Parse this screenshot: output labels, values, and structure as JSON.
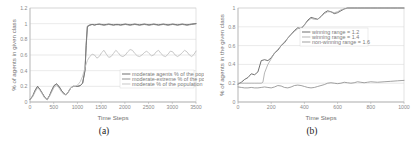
{
  "figure": {
    "panels": [
      {
        "id": "panel-a",
        "caption": "(a)",
        "chart_data": {
          "type": "line",
          "title": "",
          "xlabel": "Time Steps",
          "ylabel": "% of agents in given class",
          "xlim": [
            0,
            3500
          ],
          "ylim": [
            0,
            1.2
          ],
          "xticks": [
            0,
            500,
            1000,
            1500,
            2000,
            2500,
            3000,
            3500
          ],
          "xticklabels": [
            "0",
            "500",
            "1000",
            "1500",
            "2000",
            "2500",
            "3000",
            "3500"
          ],
          "yticks": [
            0,
            0.2,
            0.4,
            0.6,
            0.8,
            1,
            1.2
          ],
          "yticklabels": [
            "0",
            "0.2",
            "0.4",
            "0.6",
            "0.8",
            "1",
            "1.2"
          ],
          "grid": true,
          "legend_position": "lower-right",
          "series": [
            {
              "name": "moderate agents % of the population = 1.2",
              "color": "#555555",
              "x": [
                0,
                60,
                110,
                160,
                210,
                260,
                310,
                360,
                410,
                460,
                510,
                560,
                610,
                660,
                710,
                760,
                810,
                860,
                910,
                960,
                1010,
                1060,
                1110,
                1160,
                1185,
                1210,
                1260,
                1310,
                1360,
                1410,
                1460,
                1510,
                1560,
                1610,
                1660,
                1710,
                1760,
                1810,
                1860,
                1910,
                1960,
                2010,
                2060,
                2110,
                2160,
                2210,
                2260,
                2310,
                2360,
                2410,
                2460,
                2510,
                2560,
                2610,
                2660,
                2710,
                2760,
                2810,
                2860,
                2910,
                2960,
                3010,
                3060,
                3110,
                3160,
                3210,
                3260,
                3310,
                3360,
                3410,
                3460,
                3500
              ],
              "y": [
                0.03,
                0.08,
                0.15,
                0.2,
                0.16,
                0.11,
                0.06,
                0.03,
                0.08,
                0.15,
                0.21,
                0.23,
                0.2,
                0.15,
                0.11,
                0.09,
                0.13,
                0.18,
                0.2,
                0.2,
                0.2,
                0.21,
                0.24,
                0.4,
                0.72,
                0.96,
                0.98,
                0.99,
                0.985,
                0.99,
                0.995,
                0.99,
                0.985,
                0.99,
                0.995,
                0.99,
                0.985,
                0.99,
                0.99,
                0.985,
                0.99,
                0.995,
                0.99,
                0.985,
                0.99,
                0.995,
                0.99,
                0.985,
                0.99,
                0.995,
                0.99,
                0.985,
                0.99,
                0.995,
                0.99,
                0.985,
                0.99,
                0.995,
                0.99,
                0.985,
                0.99,
                0.995,
                0.99,
                0.985,
                0.99,
                0.995,
                0.99,
                0.985,
                0.99,
                0.995,
                0.998,
                1.0
              ]
            },
            {
              "name": "moderate-extreme % of the population = 1.4",
              "color": "#7d7d7d",
              "x": [
                0,
                60,
                110,
                160,
                210,
                260,
                310,
                360,
                410,
                460,
                510,
                560,
                610,
                660,
                710,
                760,
                810,
                860,
                910,
                960,
                1010,
                1060,
                1110,
                1160,
                1185,
                1210,
                1260,
                1310,
                1360,
                1410,
                1460,
                1510,
                1560,
                1610,
                1660,
                1710,
                1760,
                1810,
                1860,
                1910,
                1960,
                2010,
                2060,
                2110,
                2160,
                2210,
                2260,
                2310,
                2360,
                2410,
                2460,
                2510,
                2560,
                2610,
                2660,
                2710,
                2760,
                2810,
                2860,
                2910,
                2960,
                3010,
                3060,
                3110,
                3160,
                3210,
                3260,
                3310,
                3360,
                3410,
                3460,
                3500
              ],
              "y": [
                0.03,
                0.08,
                0.15,
                0.2,
                0.16,
                0.11,
                0.06,
                0.03,
                0.08,
                0.15,
                0.21,
                0.23,
                0.2,
                0.15,
                0.11,
                0.09,
                0.13,
                0.18,
                0.2,
                0.2,
                0.2,
                0.21,
                0.24,
                0.42,
                0.75,
                0.97,
                0.985,
                0.99,
                0.98,
                0.99,
                0.99,
                0.985,
                0.98,
                0.985,
                0.99,
                0.985,
                0.98,
                0.985,
                0.985,
                0.98,
                0.985,
                0.99,
                0.985,
                0.98,
                0.985,
                0.99,
                0.985,
                0.98,
                0.985,
                0.99,
                0.985,
                0.98,
                0.985,
                0.99,
                0.985,
                0.98,
                0.985,
                0.99,
                0.985,
                0.98,
                0.985,
                0.99,
                0.985,
                0.98,
                0.985,
                0.99,
                0.985,
                0.98,
                0.985,
                0.99,
                0.995,
                1.0
              ]
            },
            {
              "name": "moderate % of the population = 1.6",
              "color": "#bdbdbd",
              "x": [
                0,
                60,
                110,
                160,
                210,
                260,
                310,
                360,
                410,
                460,
                510,
                560,
                610,
                660,
                710,
                760,
                810,
                860,
                910,
                960,
                1010,
                1060,
                1110,
                1160,
                1210,
                1260,
                1310,
                1360,
                1410,
                1460,
                1510,
                1560,
                1610,
                1660,
                1710,
                1760,
                1810,
                1860,
                1910,
                1960,
                2010,
                2060,
                2110,
                2160,
                2210,
                2260,
                2310,
                2360,
                2410,
                2460,
                2510,
                2560,
                2610,
                2660,
                2710,
                2760,
                2810,
                2860,
                2910,
                2960,
                3010,
                3060,
                3110,
                3160,
                3210,
                3260,
                3310,
                3360,
                3410,
                3460,
                3500
              ],
              "y": [
                0.03,
                0.07,
                0.13,
                0.18,
                0.15,
                0.1,
                0.05,
                0.03,
                0.07,
                0.13,
                0.19,
                0.21,
                0.18,
                0.13,
                0.1,
                0.09,
                0.13,
                0.18,
                0.2,
                0.2,
                0.22,
                0.26,
                0.33,
                0.44,
                0.53,
                0.58,
                0.61,
                0.6,
                0.56,
                0.58,
                0.63,
                0.66,
                0.61,
                0.57,
                0.58,
                0.62,
                0.66,
                0.63,
                0.59,
                0.58,
                0.6,
                0.64,
                0.67,
                0.66,
                0.62,
                0.59,
                0.58,
                0.6,
                0.63,
                0.65,
                0.62,
                0.59,
                0.6,
                0.64,
                0.66,
                0.62,
                0.59,
                0.58,
                0.61,
                0.65,
                0.64,
                0.6,
                0.58,
                0.6,
                0.63,
                0.66,
                0.64,
                0.6,
                0.58,
                0.61,
                0.65
              ]
            }
          ]
        }
      },
      {
        "id": "panel-b",
        "caption": "(b)",
        "chart_data": {
          "type": "line",
          "title": "",
          "xlabel": "Time Steps",
          "ylabel": "% of agents in the given class",
          "xlim": [
            0,
            1000
          ],
          "ylim": [
            0,
            1
          ],
          "xticks": [
            0,
            200,
            400,
            600,
            800,
            1000
          ],
          "xticklabels": [
            "0",
            "200",
            "400",
            "600",
            "800",
            "1000"
          ],
          "yticks": [
            0,
            0.2,
            0.4,
            0.6,
            0.8,
            1
          ],
          "yticklabels": [
            "0",
            "0.2",
            "0.4",
            "0.6",
            "0.8",
            "1"
          ],
          "grid": true,
          "legend_position": "upper-center",
          "series": [
            {
              "name": "winning range = 1.2",
              "color": "#555555",
              "x": [
                0,
                20,
                40,
                60,
                80,
                100,
                120,
                140,
                160,
                180,
                200,
                220,
                240,
                260,
                280,
                300,
                320,
                340,
                360,
                380,
                400,
                420,
                440,
                460,
                480,
                500,
                520,
                540,
                560,
                580,
                600,
                620,
                640,
                660,
                680,
                700,
                720,
                740,
                760,
                800,
                840,
                880,
                920,
                960,
                1000
              ],
              "y": [
                0.19,
                0.21,
                0.24,
                0.26,
                0.3,
                0.29,
                0.32,
                0.44,
                0.45,
                0.44,
                0.47,
                0.52,
                0.55,
                0.6,
                0.63,
                0.68,
                0.72,
                0.76,
                0.79,
                0.78,
                0.82,
                0.87,
                0.9,
                0.89,
                0.88,
                0.91,
                0.95,
                0.97,
                0.96,
                0.94,
                0.95,
                0.97,
                0.99,
                1.0,
                1.0,
                1.0,
                1.0,
                1.0,
                1.0,
                1.0,
                1.0,
                1.0,
                1.0,
                1.0,
                1.0
              ]
            },
            {
              "name": "winning range = 1.4",
              "color": "#a8a8a8",
              "x": [
                0,
                20,
                40,
                60,
                80,
                100,
                120,
                140,
                150,
                160,
                180,
                200,
                220,
                240,
                260,
                280,
                300,
                320,
                340,
                360,
                380,
                400,
                420,
                440,
                460,
                480,
                500,
                520,
                540,
                560,
                580,
                600,
                620,
                640,
                660,
                680,
                700,
                740,
                780,
                820,
                860,
                900,
                940,
                1000
              ],
              "y": [
                0.2,
                0.2,
                0.2,
                0.2,
                0.2,
                0.2,
                0.2,
                0.2,
                0.21,
                0.31,
                0.4,
                0.46,
                0.52,
                0.56,
                0.6,
                0.64,
                0.68,
                0.72,
                0.75,
                0.78,
                0.79,
                0.82,
                0.86,
                0.89,
                0.88,
                0.88,
                0.91,
                0.94,
                0.96,
                0.96,
                0.95,
                0.96,
                0.98,
                0.99,
                1.0,
                1.0,
                1.0,
                1.0,
                1.0,
                1.0,
                1.0,
                1.0,
                1.0,
                1.0
              ]
            },
            {
              "name": "non-winning range = 1.6",
              "color": "#8f8f8f",
              "x": [
                0,
                20,
                40,
                60,
                80,
                100,
                120,
                140,
                160,
                180,
                200,
                220,
                240,
                260,
                280,
                300,
                320,
                340,
                360,
                380,
                400,
                420,
                440,
                460,
                480,
                500,
                520,
                540,
                560,
                580,
                600,
                620,
                640,
                660,
                680,
                700,
                720,
                740,
                760,
                780,
                800,
                840,
                880,
                920,
                960,
                1000
              ],
              "y": [
                0.16,
                0.155,
                0.15,
                0.15,
                0.155,
                0.15,
                0.15,
                0.155,
                0.16,
                0.155,
                0.15,
                0.16,
                0.175,
                0.17,
                0.155,
                0.15,
                0.16,
                0.175,
                0.18,
                0.175,
                0.165,
                0.155,
                0.15,
                0.155,
                0.165,
                0.175,
                0.185,
                0.2,
                0.205,
                0.2,
                0.195,
                0.2,
                0.21,
                0.205,
                0.2,
                0.205,
                0.215,
                0.21,
                0.205,
                0.21,
                0.215,
                0.21,
                0.215,
                0.22,
                0.225,
                0.23
              ]
            }
          ]
        }
      }
    ]
  }
}
